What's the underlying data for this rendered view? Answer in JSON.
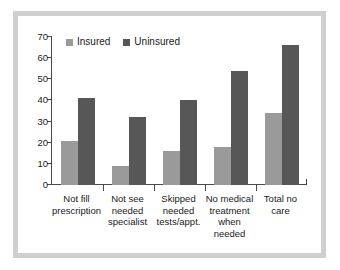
{
  "chart_data": {
    "type": "bar",
    "title": "",
    "subtitle": "",
    "xlabel": "",
    "ylabel": "",
    "ylim": [
      0,
      70
    ],
    "yticks": [
      0,
      10,
      20,
      30,
      40,
      50,
      60,
      70
    ],
    "grid": false,
    "legend_position": "top-left-inside",
    "categories": [
      "Not fill prescription",
      "Not see needed specialist",
      "Skipped needed tests/appt.",
      "No medical treatment when needed",
      "Total no care"
    ],
    "category_lines": [
      [
        "Not fill",
        "prescription"
      ],
      [
        "Not see",
        "needed",
        "specialist"
      ],
      [
        "Skipped",
        "needed",
        "tests/appt."
      ],
      [
        "No medical",
        "treatment",
        "when",
        "needed"
      ],
      [
        "Total no",
        "care"
      ]
    ],
    "series": [
      {
        "name": "Insured",
        "color": "#9a9a9a",
        "values": [
          21,
          9,
          16,
          18,
          34
        ]
      },
      {
        "name": "Uninsured",
        "color": "#575757",
        "values": [
          41,
          32,
          40,
          54,
          66
        ]
      }
    ]
  },
  "axis": {
    "y_tick_labels": [
      "70",
      "60",
      "50",
      "40",
      "30",
      "20",
      "10",
      "0"
    ],
    "axis_color": "#4a4a4a"
  },
  "legend": {
    "items": [
      {
        "label": "Insured",
        "swatch": "insured"
      },
      {
        "label": "Uninsured",
        "swatch": "uninsured"
      }
    ]
  },
  "frame": {
    "border_color": "#cfcfcf",
    "background": "#ffffff"
  }
}
